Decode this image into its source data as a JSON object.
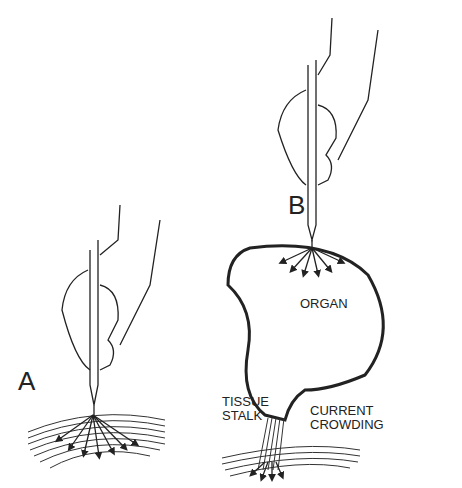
{
  "panels": [
    {
      "id": "A",
      "label": "A"
    },
    {
      "id": "B",
      "label": "B"
    }
  ],
  "labels": {
    "organ": "ORGAN",
    "tissue_stalk_1": "TISSUE",
    "tissue_stalk_2": "STALK",
    "current_crowding_1": "CURRENT",
    "current_crowding_2": "CROWDING"
  }
}
